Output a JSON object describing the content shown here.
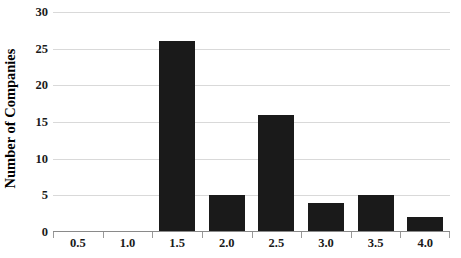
{
  "chart_data": {
    "type": "bar",
    "title": "",
    "subtitle": "",
    "xlabel": "",
    "ylabel": "Number of Companies",
    "categories": [
      "0.5",
      "1.0",
      "1.5",
      "2.0",
      "2.5",
      "3.0",
      "3.5",
      "4.0"
    ],
    "values": [
      0,
      0,
      26,
      5,
      16,
      4,
      5,
      2
    ],
    "ylim": [
      0,
      30
    ],
    "y_ticks": [
      "0",
      "5",
      "10",
      "15",
      "20",
      "25",
      "30"
    ],
    "y_tick_values": [
      0,
      5,
      10,
      15,
      20,
      25,
      30
    ],
    "grid": true,
    "legend": "none",
    "bar_color": "#1a1a1a",
    "gridline_color": "#d9d9d9",
    "axis_color": "#8a8a8a",
    "background_color": "#ffffff"
  }
}
